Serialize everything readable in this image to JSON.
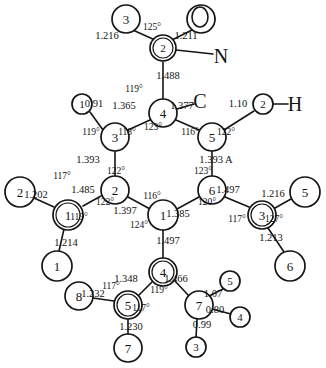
{
  "diagram": {
    "unit_note": "1.393 A",
    "stroke_color": "#151515",
    "background_color": "#ffffff"
  },
  "element_labels": [
    {
      "name": "element-label-N",
      "text": "N",
      "x": 221,
      "y": 56
    },
    {
      "name": "element-label-C",
      "text": "C",
      "x": 200,
      "y": 101
    },
    {
      "name": "element-label-H",
      "text": "H",
      "x": 295,
      "y": 104
    },
    {
      "name": "element-label-O",
      "text": "O",
      "x": 200,
      "y": 17
    }
  ],
  "atoms": [
    {
      "name": "atom-o3-top",
      "label": "3",
      "x": 126,
      "y": 19,
      "r": 14,
      "double": false
    },
    {
      "name": "atom-o4-top",
      "label": "4",
      "x": 201,
      "y": 19,
      "r": 14,
      "double": false
    },
    {
      "name": "atom-n2",
      "label": "2",
      "x": 163,
      "y": 48,
      "r": 13,
      "double": true
    },
    {
      "name": "atom-c4-ring-top",
      "label": "4",
      "x": 163,
      "y": 113,
      "r": 14,
      "double": false
    },
    {
      "name": "atom-c3-ring-left",
      "label": "3",
      "x": 115,
      "y": 137,
      "r": 14,
      "double": false
    },
    {
      "name": "atom-c5-ring-right",
      "label": "5",
      "x": 212,
      "y": 137,
      "r": 14,
      "double": false
    },
    {
      "name": "atom-h1-left-top",
      "label": "1",
      "x": 82,
      "y": 104,
      "r": 10,
      "double": false
    },
    {
      "name": "atom-h2-right-top",
      "label": "2",
      "x": 263,
      "y": 104,
      "r": 10,
      "double": false
    },
    {
      "name": "atom-c2-ring-left",
      "label": "2",
      "x": 115,
      "y": 190,
      "r": 14,
      "double": false
    },
    {
      "name": "atom-c6-ring-right",
      "label": "6",
      "x": 212,
      "y": 190,
      "r": 14,
      "double": false
    },
    {
      "name": "atom-c1-ring-center",
      "label": "1",
      "x": 163,
      "y": 215,
      "r": 15,
      "double": false
    },
    {
      "name": "atom-c1-left-sub",
      "label": "1",
      "x": 68,
      "y": 215,
      "r": 15,
      "double": true
    },
    {
      "name": "atom-o2-left",
      "label": "2",
      "x": 20,
      "y": 192,
      "r": 15,
      "double": false
    },
    {
      "name": "atom-o1-left-low",
      "label": "1",
      "x": 57,
      "y": 266,
      "r": 15,
      "double": false
    },
    {
      "name": "atom-c3-right-sub",
      "label": "3",
      "x": 262,
      "y": 215,
      "r": 14,
      "double": true
    },
    {
      "name": "atom-o5-right",
      "label": "5",
      "x": 305,
      "y": 192,
      "r": 15,
      "double": false
    },
    {
      "name": "atom-o6-right-low",
      "label": "6",
      "x": 290,
      "y": 266,
      "r": 15,
      "double": false
    },
    {
      "name": "atom-c4-bottom",
      "label": "4",
      "x": 163,
      "y": 272,
      "r": 14,
      "double": true
    },
    {
      "name": "atom-c5-bottom",
      "label": "5",
      "x": 128,
      "y": 305,
      "r": 14,
      "double": true
    },
    {
      "name": "atom-o8-bottom-left",
      "label": "8",
      "x": 79,
      "y": 296,
      "r": 14,
      "double": false
    },
    {
      "name": "atom-o7-bottom",
      "label": "7",
      "x": 128,
      "y": 348,
      "r": 14,
      "double": false
    },
    {
      "name": "atom-n7-bottom",
      "label": "7",
      "x": 199,
      "y": 305,
      "r": 14,
      "double": false
    },
    {
      "name": "atom-h5-bottom",
      "label": "5",
      "x": 230,
      "y": 281,
      "r": 10,
      "double": false
    },
    {
      "name": "atom-h4-bottom",
      "label": "4",
      "x": 240,
      "y": 317,
      "r": 10,
      "double": false
    },
    {
      "name": "atom-h3-bottom",
      "label": "3",
      "x": 196,
      "y": 347,
      "r": 10,
      "double": false
    }
  ],
  "bonds": [
    {
      "name": "bond-o3-n2",
      "x1": 135,
      "y1": 31,
      "x2": 155,
      "y2": 40
    },
    {
      "name": "bond-o4-n2",
      "x1": 192,
      "y1": 30,
      "x2": 172,
      "y2": 40
    },
    {
      "name": "bond-o4-O",
      "x1": 215,
      "y1": 19,
      "x2": 192,
      "y2": 19
    },
    {
      "name": "bond-n2-N",
      "x1": 176,
      "y1": 50,
      "x2": 213,
      "y2": 54
    },
    {
      "name": "bond-n2-c4",
      "x1": 163,
      "y1": 62,
      "x2": 163,
      "y2": 99
    },
    {
      "name": "bond-c4-C",
      "x1": 177,
      "y1": 109,
      "x2": 194,
      "y2": 104
    },
    {
      "name": "bond-c4-c3",
      "x1": 150,
      "y1": 120,
      "x2": 128,
      "y2": 130
    },
    {
      "name": "bond-c4-c5",
      "x1": 176,
      "y1": 120,
      "x2": 199,
      "y2": 130
    },
    {
      "name": "bond-c3-h1",
      "x1": 103,
      "y1": 130,
      "x2": 90,
      "y2": 112
    },
    {
      "name": "bond-c5-h2",
      "x1": 224,
      "y1": 130,
      "x2": 254,
      "y2": 111
    },
    {
      "name": "bond-h2-H",
      "x1": 273,
      "y1": 104,
      "x2": 288,
      "y2": 104
    },
    {
      "name": "bond-c3-c2",
      "x1": 115,
      "y1": 151,
      "x2": 115,
      "y2": 176
    },
    {
      "name": "bond-c5-c6",
      "x1": 212,
      "y1": 151,
      "x2": 212,
      "y2": 176
    },
    {
      "name": "bond-c2-c1",
      "x1": 128,
      "y1": 197,
      "x2": 150,
      "y2": 209
    },
    {
      "name": "bond-c6-c1",
      "x1": 199,
      "y1": 197,
      "x2": 177,
      "y2": 209
    },
    {
      "name": "bond-c2-sub",
      "x1": 101,
      "y1": 196,
      "x2": 83,
      "y2": 206
    },
    {
      "name": "bond-sub-o2",
      "x1": 54,
      "y1": 207,
      "x2": 34,
      "y2": 198
    },
    {
      "name": "bond-sub-o1",
      "x1": 64,
      "y1": 229,
      "x2": 59,
      "y2": 251
    },
    {
      "name": "bond-c6-sub",
      "x1": 225,
      "y1": 197,
      "x2": 249,
      "y2": 207
    },
    {
      "name": "bond-sub-o5",
      "x1": 275,
      "y1": 208,
      "x2": 291,
      "y2": 199
    },
    {
      "name": "bond-sub-o6",
      "x1": 268,
      "y1": 228,
      "x2": 284,
      "y2": 252
    },
    {
      "name": "bond-c1-c4b",
      "x1": 163,
      "y1": 230,
      "x2": 163,
      "y2": 258
    },
    {
      "name": "bond-c4b-c5b",
      "x1": 152,
      "y1": 282,
      "x2": 139,
      "y2": 295
    },
    {
      "name": "bond-c4b-n7",
      "x1": 175,
      "y1": 281,
      "x2": 188,
      "y2": 295
    },
    {
      "name": "bond-c5b-o8",
      "x1": 114,
      "y1": 301,
      "x2": 93,
      "y2": 298
    },
    {
      "name": "bond-c5b-o7",
      "x1": 128,
      "y1": 319,
      "x2": 128,
      "y2": 334
    },
    {
      "name": "bond-n7-h5",
      "x1": 209,
      "y1": 296,
      "x2": 223,
      "y2": 289
    },
    {
      "name": "bond-n7-h4",
      "x1": 212,
      "y1": 309,
      "x2": 231,
      "y2": 314
    },
    {
      "name": "bond-n7-h3",
      "x1": 197,
      "y1": 319,
      "x2": 196,
      "y2": 338
    }
  ],
  "bond_lengths": [
    {
      "name": "bond-length-1216-top",
      "text": "1.216",
      "x": 107,
      "y": 36,
      "rot": 0
    },
    {
      "name": "bond-length-1211-top",
      "text": "1.211",
      "x": 186,
      "y": 36,
      "rot": 0
    },
    {
      "name": "bond-length-1488",
      "text": "1.488",
      "x": 168,
      "y": 76,
      "rot": 0
    },
    {
      "name": "bond-length-091",
      "text": "0.91",
      "x": 94,
      "y": 104,
      "rot": 0
    },
    {
      "name": "bond-length-1365",
      "text": "1.365",
      "x": 124,
      "y": 106,
      "rot": 0
    },
    {
      "name": "bond-length-1377",
      "text": "1.377",
      "x": 182,
      "y": 106,
      "rot": 0
    },
    {
      "name": "bond-length-110",
      "text": "1.10",
      "x": 238,
      "y": 104,
      "rot": 0
    },
    {
      "name": "bond-length-1393-left",
      "text": "1.393",
      "x": 88,
      "y": 160,
      "rot": 0
    },
    {
      "name": "bond-length-1393-right",
      "text": "1.393 A",
      "x": 216,
      "y": 160,
      "rot": 0
    },
    {
      "name": "bond-length-1202",
      "text": "1.202",
      "x": 36,
      "y": 195,
      "rot": 0
    },
    {
      "name": "bond-length-1485",
      "text": "1.485",
      "x": 83,
      "y": 190,
      "rot": 0
    },
    {
      "name": "bond-length-1214",
      "text": "1.214",
      "x": 66,
      "y": 243,
      "rot": 0
    },
    {
      "name": "bond-length-1397",
      "text": "1.397",
      "x": 125,
      "y": 211,
      "rot": 0
    },
    {
      "name": "bond-length-1385",
      "text": "1.385",
      "x": 178,
      "y": 214,
      "rot": 0
    },
    {
      "name": "bond-length-1497-right",
      "text": "1.497",
      "x": 228,
      "y": 190,
      "rot": 0
    },
    {
      "name": "bond-length-1216-right",
      "text": "1.216",
      "x": 273,
      "y": 194,
      "rot": 0
    },
    {
      "name": "bond-length-1213",
      "text": "1.213",
      "x": 271,
      "y": 238,
      "rot": 0
    },
    {
      "name": "bond-length-1497-center",
      "text": "1.497",
      "x": 168,
      "y": 241,
      "rot": 0
    },
    {
      "name": "bond-length-1348",
      "text": "1.348",
      "x": 126,
      "y": 279,
      "rot": 0
    },
    {
      "name": "bond-length-1466",
      "text": "1.466",
      "x": 176,
      "y": 279,
      "rot": 0
    },
    {
      "name": "bond-length-1232",
      "text": "1.232",
      "x": 93,
      "y": 294,
      "rot": 0
    },
    {
      "name": "bond-length-1230",
      "text": "1.230",
      "x": 131,
      "y": 327,
      "rot": 0
    },
    {
      "name": "bond-length-107",
      "text": "1.07",
      "x": 213,
      "y": 294,
      "rot": 0
    },
    {
      "name": "bond-length-080",
      "text": "0.80",
      "x": 215,
      "y": 310,
      "rot": 0
    },
    {
      "name": "bond-length-099",
      "text": "0.99",
      "x": 202,
      "y": 325,
      "rot": 0
    }
  ],
  "bond_angles": [
    {
      "name": "angle-125",
      "text": "125°",
      "x": 152,
      "y": 28
    },
    {
      "name": "angle-119-top",
      "text": "119°",
      "x": 134,
      "y": 90
    },
    {
      "name": "angle-123-c4",
      "text": "123°",
      "x": 153,
      "y": 128
    },
    {
      "name": "angle-119-c3",
      "text": "119°",
      "x": 91,
      "y": 133
    },
    {
      "name": "angle-118-c3",
      "text": "118°",
      "x": 127,
      "y": 133
    },
    {
      "name": "angle-116-c5",
      "text": "116°",
      "x": 190,
      "y": 133
    },
    {
      "name": "angle-122-c5",
      "text": "122°",
      "x": 226,
      "y": 133
    },
    {
      "name": "angle-117-c2sub",
      "text": "117°",
      "x": 62,
      "y": 177
    },
    {
      "name": "angle-119-c2sub",
      "text": "119°",
      "x": 79,
      "y": 218
    },
    {
      "name": "angle-122-c2",
      "text": "122°",
      "x": 116,
      "y": 172
    },
    {
      "name": "angle-122-c2low",
      "text": "122°",
      "x": 105,
      "y": 203
    },
    {
      "name": "angle-123-c6",
      "text": "123°",
      "x": 203,
      "y": 172
    },
    {
      "name": "angle-120-c6",
      "text": "120°",
      "x": 207,
      "y": 203
    },
    {
      "name": "angle-116-c1",
      "text": "116°",
      "x": 152,
      "y": 197
    },
    {
      "name": "angle-124-c1",
      "text": "124°",
      "x": 139,
      "y": 226
    },
    {
      "name": "angle-117-c3sub",
      "text": "117°",
      "x": 237,
      "y": 220
    },
    {
      "name": "angle-127-c3sub",
      "text": "127°",
      "x": 274,
      "y": 220
    },
    {
      "name": "angle-117-c5b",
      "text": "117°",
      "x": 111,
      "y": 287
    },
    {
      "name": "angle-117-c5b2",
      "text": "117°",
      "x": 141,
      "y": 309
    },
    {
      "name": "angle-119-c4b",
      "text": "119°",
      "x": 159,
      "y": 291
    }
  ]
}
